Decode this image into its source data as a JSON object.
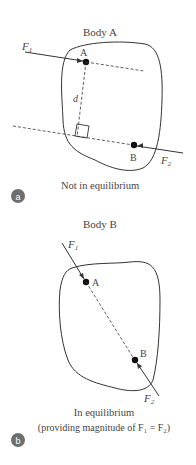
{
  "panel_a": {
    "title": "Body A",
    "force1": "F",
    "force1_sub": "1",
    "force2": "F",
    "force2_sub": "2",
    "point_a": "A",
    "point_b": "B",
    "distance": "d",
    "caption": "Not in equilibrium",
    "badge": "a"
  },
  "panel_b": {
    "title": "Body B",
    "force1": "F",
    "force1_sub": "1",
    "force2": "F",
    "force2_sub": "2",
    "point_a": "A",
    "point_b": "B",
    "caption": "In equilibrium",
    "caption2": "(providing magnitude of F₁ = F₂)",
    "badge": "b"
  },
  "colors": {
    "line": "#333333",
    "badge": "#6e6e6e"
  }
}
